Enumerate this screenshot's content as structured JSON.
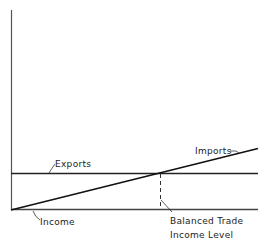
{
  "diagram": {
    "type": "economics-line-diagram",
    "axes": {
      "x_label": "Income",
      "y_label": ""
    },
    "lines": {
      "exports": {
        "label": "Exports",
        "shape": "horizontal"
      },
      "imports": {
        "label": "Imports",
        "shape": "upward-sloping from origin"
      }
    },
    "equilibrium": {
      "label_line1": "Balanced Trade",
      "label_line2": "Income Level"
    },
    "colors": {
      "ink": "#222222",
      "background": "#ffffff"
    }
  }
}
